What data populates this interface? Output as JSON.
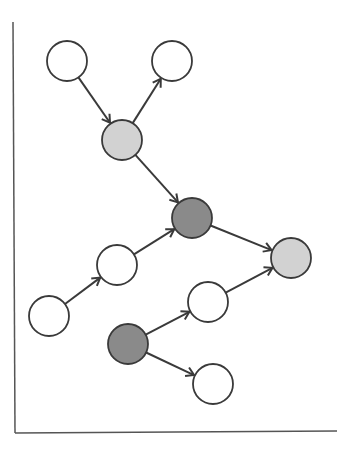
{
  "diagram": {
    "type": "directed-graph",
    "colors": {
      "white_node": "#ffffff",
      "light_node": "#d2d2d2",
      "dark_node": "#8a8a8a",
      "stroke": "#3a3a3a",
      "axis": "#555555"
    },
    "axes": {
      "vertical": {
        "x1": 13,
        "y1": 22,
        "x2": 15,
        "y2": 433
      },
      "horizontal": {
        "x1": 15,
        "y1": 433,
        "x2": 337,
        "y2": 431
      }
    },
    "node_radius": 20,
    "nodes": [
      {
        "id": "n1",
        "x": 67,
        "y": 61,
        "fill": "white"
      },
      {
        "id": "n2",
        "x": 172,
        "y": 61,
        "fill": "white"
      },
      {
        "id": "n3",
        "x": 122,
        "y": 140,
        "fill": "light"
      },
      {
        "id": "n4",
        "x": 192,
        "y": 218,
        "fill": "dark"
      },
      {
        "id": "n5",
        "x": 291,
        "y": 258,
        "fill": "light"
      },
      {
        "id": "n6",
        "x": 117,
        "y": 265,
        "fill": "white"
      },
      {
        "id": "n7",
        "x": 49,
        "y": 316,
        "fill": "white"
      },
      {
        "id": "n8",
        "x": 208,
        "y": 302,
        "fill": "white"
      },
      {
        "id": "n9",
        "x": 128,
        "y": 344,
        "fill": "dark"
      },
      {
        "id": "n10",
        "x": 213,
        "y": 384,
        "fill": "white"
      }
    ],
    "edges": [
      {
        "from": "n1",
        "to": "n3"
      },
      {
        "from": "n3",
        "to": "n2"
      },
      {
        "from": "n3",
        "to": "n4"
      },
      {
        "from": "n7",
        "to": "n6"
      },
      {
        "from": "n6",
        "to": "n4"
      },
      {
        "from": "n4",
        "to": "n5"
      },
      {
        "from": "n8",
        "to": "n5"
      },
      {
        "from": "n9",
        "to": "n8"
      },
      {
        "from": "n9",
        "to": "n10"
      }
    ]
  }
}
